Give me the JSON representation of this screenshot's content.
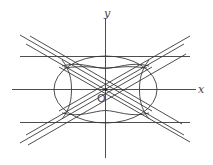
{
  "diagram": {
    "title": "",
    "labels": {
      "x_axis": "x",
      "y_axis": "y",
      "origin": "O"
    },
    "colors": {
      "stroke": "#3a3a3a",
      "background": "#ffffff"
    },
    "elements": [
      "x-axis",
      "y-axis",
      "ellipse centered at origin",
      "hyperbola opening up/down (inside ellipse)",
      "hyperbola opening left/right (inside ellipse)",
      "two horizontal lines tangent to top and bottom of ellipse",
      "three pairs of crossing diagonal lines (asymptotes and tangents)"
    ]
  }
}
